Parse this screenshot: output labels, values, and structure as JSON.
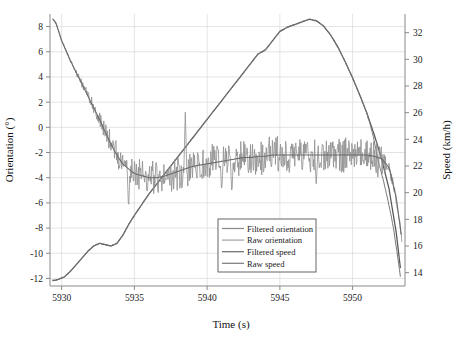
{
  "chart_data": {
    "type": "line",
    "title": "",
    "xlabel": "Time (s)",
    "ylabel": "Orientation (°)",
    "y2label": "Speed (km/h)",
    "xlim": [
      5929.2,
      5953.6
    ],
    "ylim": [
      -12.6,
      9.0
    ],
    "y2lim": [
      13.0,
      33.4
    ],
    "grid": true,
    "legend_position": "lower-center-right",
    "xticks": [
      5930,
      5935,
      5940,
      5945,
      5950
    ],
    "xtick_labels": [
      "5930",
      "5935",
      "5940",
      "5945",
      "5950"
    ],
    "yticks": [
      -12,
      -10,
      -8,
      -6,
      -4,
      -2,
      0,
      2,
      4,
      6,
      8
    ],
    "ytick_labels": [
      "-12",
      "-10",
      "-8",
      "-6",
      "-4",
      "-2",
      "0",
      "2",
      "4",
      "6",
      "8"
    ],
    "y2ticks": [
      14,
      16,
      18,
      20,
      22,
      24,
      26,
      28,
      30,
      32
    ],
    "y2tick_labels": [
      "14",
      "16",
      "18",
      "20",
      "22",
      "24",
      "26",
      "28",
      "30",
      "32"
    ],
    "colors": {
      "filtered_orientation": "#6b6b6b",
      "raw_orientation": "#8e8e8e",
      "filtered_speed": "#555555",
      "raw_speed": "#777777",
      "grid": "#d9d9d9",
      "frame": "#8a8a8a",
      "background": "#ffffff"
    },
    "series": [
      {
        "name": "Filtered orientation",
        "axis": "left",
        "x": [
          5929.4,
          5929.6,
          5929.8,
          5930.0,
          5930.3,
          5930.6,
          5930.9,
          5931.2,
          5931.5,
          5931.8,
          5932.1,
          5932.4,
          5932.7,
          5933.0,
          5933.3,
          5933.6,
          5933.9,
          5934.2,
          5934.5,
          5934.8,
          5935.1,
          5935.4,
          5935.7,
          5936.0,
          5936.5,
          5937.0,
          5937.5,
          5938.0,
          5938.5,
          5939.0,
          5939.5,
          5940.0,
          5940.5,
          5941.0,
          5941.5,
          5942.0,
          5942.5,
          5943.0,
          5943.5,
          5944.0,
          5944.5,
          5945.0,
          5945.5,
          5946.0,
          5946.5,
          5947.0,
          5947.5,
          5948.0,
          5948.5,
          5949.0,
          5949.5,
          5950.0,
          5950.5,
          5951.0,
          5951.5,
          5952.0,
          5952.5,
          5953.0,
          5953.4
        ],
        "y": [
          8.6,
          8.3,
          7.6,
          6.9,
          6.1,
          5.3,
          4.6,
          3.9,
          3.2,
          2.5,
          1.8,
          1.1,
          0.4,
          -0.4,
          -1.1,
          -1.8,
          -2.4,
          -2.9,
          -3.2,
          -3.5,
          -3.7,
          -3.8,
          -3.9,
          -4.0,
          -4.0,
          -3.9,
          -3.7,
          -3.5,
          -3.3,
          -3.1,
          -3.0,
          -2.9,
          -2.8,
          -2.7,
          -2.6,
          -2.5,
          -2.4,
          -2.4,
          -2.3,
          -2.3,
          -2.2,
          -2.2,
          -2.2,
          -2.2,
          -2.2,
          -2.2,
          -2.2,
          -2.2,
          -2.2,
          -2.2,
          -2.2,
          -2.2,
          -2.2,
          -2.2,
          -2.3,
          -2.5,
          -3.2,
          -5.6,
          -9.0
        ]
      },
      {
        "name": "Raw orientation",
        "axis": "left",
        "description": "Noisy signal about the filtered orientation, noise amplitude ~0.3° early rising to ~1.2° in mid-range, with occasional spikes up to 3°",
        "noise_amplitude": 1.0,
        "spikes": [
          {
            "x": 5934.6,
            "y": -6.6
          },
          {
            "x": 5938.5,
            "y": 1.2
          },
          {
            "x": 5941.0,
            "y": -5.2
          },
          {
            "x": 5941.7,
            "y": -5.4
          },
          {
            "x": 5947.5,
            "y": -4.6
          }
        ]
      },
      {
        "name": "Filtered speed",
        "axis": "right",
        "x": [
          5929.4,
          5929.8,
          5930.2,
          5930.6,
          5931.0,
          5931.4,
          5931.8,
          5932.2,
          5932.6,
          5933.0,
          5933.4,
          5933.8,
          5934.2,
          5934.6,
          5935.0,
          5935.5,
          5936.0,
          5936.5,
          5937.0,
          5937.5,
          5938.0,
          5938.5,
          5939.0,
          5939.5,
          5940.0,
          5940.5,
          5941.0,
          5941.5,
          5942.0,
          5942.5,
          5943.0,
          5943.5,
          5944.0,
          5944.5,
          5945.0,
          5945.5,
          5946.0,
          5946.5,
          5947.0,
          5947.5,
          5948.0,
          5948.5,
          5949.0,
          5949.5,
          5950.0,
          5950.5,
          5951.0,
          5951.5,
          5952.0,
          5952.5,
          5953.0,
          5953.3
        ],
        "y": [
          13.4,
          13.5,
          13.7,
          14.1,
          14.6,
          15.1,
          15.6,
          16.0,
          16.2,
          16.1,
          16.0,
          16.2,
          16.8,
          17.6,
          18.3,
          19.1,
          19.9,
          20.6,
          21.3,
          22.0,
          22.7,
          23.4,
          24.1,
          24.8,
          25.5,
          26.2,
          26.9,
          27.6,
          28.3,
          29.0,
          29.7,
          30.4,
          30.7,
          31.4,
          32.1,
          32.4,
          32.6,
          32.8,
          33.0,
          32.9,
          32.5,
          31.8,
          30.9,
          29.8,
          28.6,
          27.3,
          25.9,
          24.3,
          22.5,
          20.3,
          17.0,
          14.2
        ]
      },
      {
        "name": "Raw speed",
        "axis": "right",
        "description": "Nearly coincident with filtered speed; slight deviation at the end of the trace dropping faster",
        "x": [
          5951.2,
          5951.6,
          5952.0,
          5952.4,
          5952.8,
          5953.1,
          5953.3
        ],
        "y": [
          24.8,
          23.0,
          21.4,
          19.6,
          17.4,
          15.2,
          13.6
        ]
      }
    ],
    "legend": [
      {
        "label": "Filtered orientation",
        "color": "#8a8a8a"
      },
      {
        "label": "Raw orientation",
        "color": "#a8a8a8"
      },
      {
        "label": "Filtered speed",
        "color": "#6f6f6f"
      },
      {
        "label": "Raw speed",
        "color": "#7d7d7d"
      }
    ]
  }
}
